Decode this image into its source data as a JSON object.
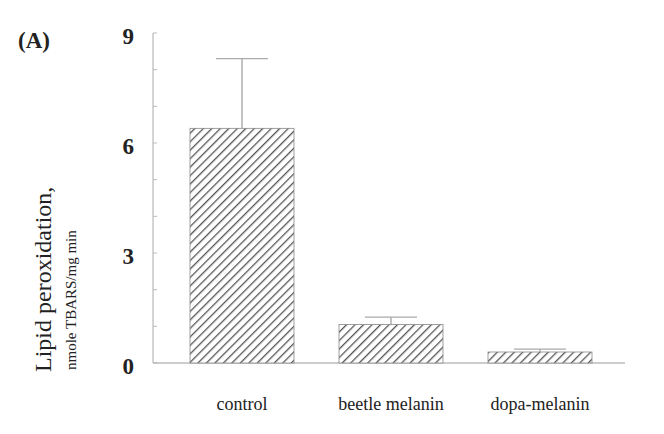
{
  "panel_label": "(A)",
  "chart_data": {
    "type": "bar",
    "title": "",
    "panel": "(A)",
    "categories": [
      "control",
      "beetle melanin",
      "dopa-melanin"
    ],
    "values": [
      6.4,
      1.05,
      0.3
    ],
    "error_bars_upper": [
      1.9,
      0.2,
      0.08
    ],
    "xlabel": "",
    "ylabel": "Lipid peroxidation,",
    "ylabel_units": "nmole TBARS/mg min",
    "ylim": [
      0,
      9
    ],
    "yticks": [
      "0",
      "3",
      "6",
      "9"
    ],
    "grid": false,
    "legend": null,
    "bar_fill": "diagonal hatch",
    "colors": {
      "bar_hatch": "#555555",
      "axis": "#999999"
    }
  }
}
